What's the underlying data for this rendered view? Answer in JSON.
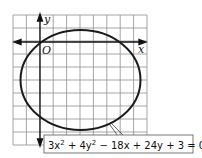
{
  "diagram": {
    "type": "ellipse-graph",
    "axes": {
      "x_label": "x",
      "y_label": "y",
      "origin_label": "O"
    },
    "grid": {
      "columns": 10,
      "rows": 10,
      "color": "#8a8a8a"
    },
    "curve_color": "#1a1a1a",
    "equation": {
      "parts": [
        "3x",
        "2",
        " + 4y",
        "2",
        " − 18x + 24y + 3 = 0"
      ],
      "full": "3x² + 4y² − 18x + 24y + 3 = 0"
    }
  }
}
